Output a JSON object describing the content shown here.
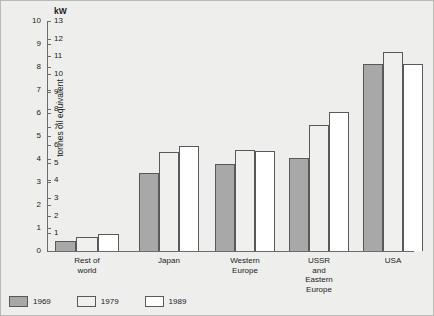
{
  "chart_data": {
    "type": "bar",
    "title": "",
    "xlabel": "",
    "ylabel": "tonnes oil equivalent",
    "y2label": "kW",
    "ylim": [
      0,
      10
    ],
    "y2lim": [
      0,
      13
    ],
    "grid": false,
    "legend_position": "bottom-left",
    "categories": [
      "Rest of world",
      "Japan",
      "Western Europe",
      "USSR and\nEastern Europe",
      "USA"
    ],
    "series": [
      {
        "name": "1969",
        "color": "#a8a8a8",
        "values": [
          0.45,
          3.4,
          3.8,
          4.05,
          8.15
        ]
      },
      {
        "name": "1979",
        "color": "#f0f0ee",
        "values": [
          0.6,
          4.3,
          4.4,
          5.5,
          8.65
        ]
      },
      {
        "name": "1989",
        "color": "#ffffff",
        "values": [
          0.75,
          4.55,
          4.35,
          6.05,
          8.15
        ]
      }
    ],
    "yticks": [
      "0",
      "1",
      "2",
      "3",
      "4",
      "5",
      "6",
      "7",
      "8",
      "9",
      "10"
    ],
    "y2ticks": [
      "1",
      "2",
      "3",
      "4",
      "5",
      "6",
      "7",
      "8",
      "9",
      "10",
      "11",
      "12",
      "13"
    ]
  },
  "legend": {
    "items": [
      {
        "label": "1969"
      },
      {
        "label": "1979"
      },
      {
        "label": "1989"
      }
    ]
  }
}
